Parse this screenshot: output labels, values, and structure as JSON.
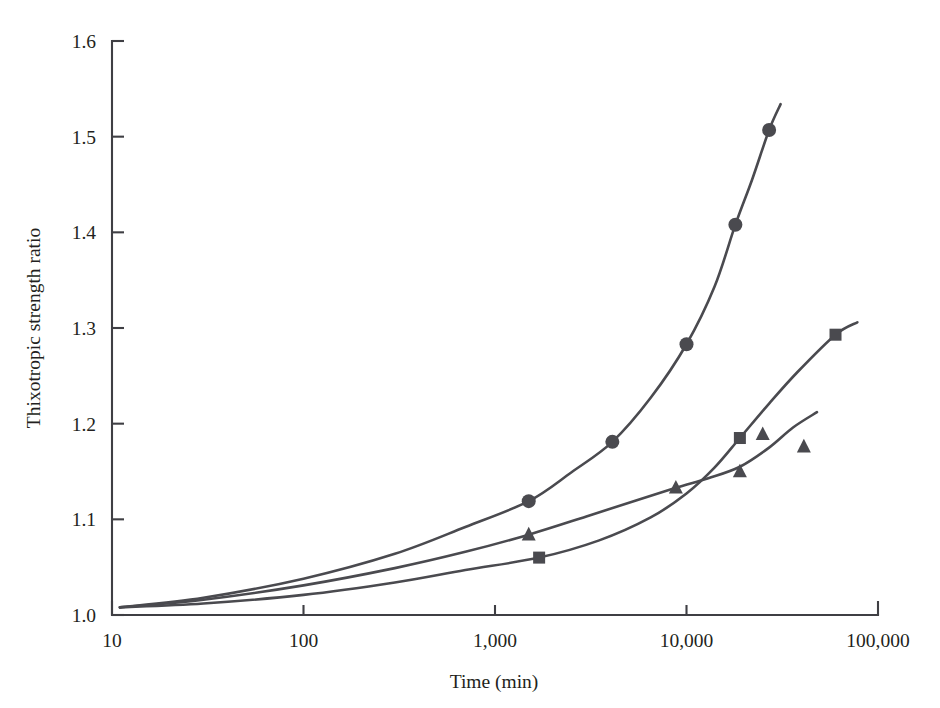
{
  "chart_data": {
    "type": "line",
    "title": "",
    "xlabel": "Time (min)",
    "ylabel": "Thixotropic strength ratio",
    "xscale": "log",
    "xlim": [
      10,
      100000
    ],
    "ylim": [
      1.0,
      1.6
    ],
    "grid": false,
    "legend": "none",
    "xticks": [
      {
        "value": 10,
        "label": "10"
      },
      {
        "value": 100,
        "label": "100"
      },
      {
        "value": 1000,
        "label": "1,000"
      },
      {
        "value": 10000,
        "label": "10,000"
      },
      {
        "value": 100000,
        "label": "100,000"
      }
    ],
    "yticks": [
      {
        "value": 1.0,
        "label": "1.0"
      },
      {
        "value": 1.1,
        "label": "1.1"
      },
      {
        "value": 1.2,
        "label": "1.2"
      },
      {
        "value": 1.3,
        "label": "1.3"
      },
      {
        "value": 1.4,
        "label": "1.4"
      },
      {
        "value": 1.5,
        "label": "1.5"
      },
      {
        "value": 1.6,
        "label": "1.6"
      }
    ],
    "series": [
      {
        "name": "series-circle",
        "marker": "circle",
        "color": "#4a4a4f",
        "points": [
          {
            "x": 1500,
            "y": 1.119
          },
          {
            "x": 4100,
            "y": 1.181
          },
          {
            "x": 10000,
            "y": 1.283
          },
          {
            "x": 18000,
            "y": 1.408
          },
          {
            "x": 27000,
            "y": 1.507
          }
        ],
        "curve": [
          {
            "x": 11,
            "y": 1.008
          },
          {
            "x": 30,
            "y": 1.018
          },
          {
            "x": 100,
            "y": 1.038
          },
          {
            "x": 300,
            "y": 1.064
          },
          {
            "x": 700,
            "y": 1.092
          },
          {
            "x": 1500,
            "y": 1.119
          },
          {
            "x": 2500,
            "y": 1.149
          },
          {
            "x": 4100,
            "y": 1.181
          },
          {
            "x": 6500,
            "y": 1.227
          },
          {
            "x": 10000,
            "y": 1.283
          },
          {
            "x": 14000,
            "y": 1.343
          },
          {
            "x": 18000,
            "y": 1.408
          },
          {
            "x": 22000,
            "y": 1.455
          },
          {
            "x": 27000,
            "y": 1.507
          },
          {
            "x": 31000,
            "y": 1.534
          }
        ]
      },
      {
        "name": "series-triangle",
        "marker": "triangle",
        "color": "#4a4a4f",
        "points": [
          {
            "x": 1500,
            "y": 1.084
          },
          {
            "x": 8800,
            "y": 1.133
          },
          {
            "x": 19000,
            "y": 1.15
          },
          {
            "x": 25000,
            "y": 1.189
          },
          {
            "x": 41000,
            "y": 1.176
          }
        ],
        "curve": [
          {
            "x": 11,
            "y": 1.008
          },
          {
            "x": 30,
            "y": 1.016
          },
          {
            "x": 100,
            "y": 1.031
          },
          {
            "x": 300,
            "y": 1.049
          },
          {
            "x": 700,
            "y": 1.066
          },
          {
            "x": 1500,
            "y": 1.084
          },
          {
            "x": 3000,
            "y": 1.103
          },
          {
            "x": 5500,
            "y": 1.12
          },
          {
            "x": 8800,
            "y": 1.133
          },
          {
            "x": 13000,
            "y": 1.143
          },
          {
            "x": 19000,
            "y": 1.155
          },
          {
            "x": 27000,
            "y": 1.175
          },
          {
            "x": 36000,
            "y": 1.196
          },
          {
            "x": 48000,
            "y": 1.212
          }
        ]
      },
      {
        "name": "series-square",
        "marker": "square",
        "color": "#4a4a4f",
        "points": [
          {
            "x": 1700,
            "y": 1.06
          },
          {
            "x": 19000,
            "y": 1.185
          },
          {
            "x": 60000,
            "y": 1.293
          }
        ],
        "curve": [
          {
            "x": 11,
            "y": 1.008
          },
          {
            "x": 30,
            "y": 1.012
          },
          {
            "x": 100,
            "y": 1.021
          },
          {
            "x": 300,
            "y": 1.034
          },
          {
            "x": 700,
            "y": 1.047
          },
          {
            "x": 1700,
            "y": 1.06
          },
          {
            "x": 3500,
            "y": 1.078
          },
          {
            "x": 6500,
            "y": 1.102
          },
          {
            "x": 10000,
            "y": 1.127
          },
          {
            "x": 14000,
            "y": 1.154
          },
          {
            "x": 19000,
            "y": 1.185
          },
          {
            "x": 27000,
            "y": 1.221
          },
          {
            "x": 38000,
            "y": 1.254
          },
          {
            "x": 60000,
            "y": 1.293
          },
          {
            "x": 78000,
            "y": 1.306
          }
        ]
      }
    ]
  }
}
